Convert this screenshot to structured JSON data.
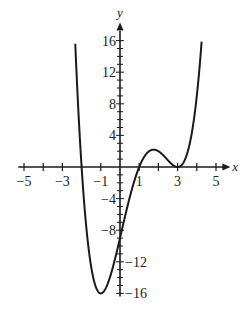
{
  "chart_data": {
    "type": "line",
    "title": "",
    "xlabel": "x",
    "ylabel": "y",
    "xlim": [
      -5.3,
      5.6
    ],
    "ylim": [
      -16.5,
      17.5
    ],
    "grid": false,
    "legend": null,
    "x_ticks_labeled": [
      -5,
      -3,
      -1,
      1,
      3,
      5
    ],
    "y_ticks_labeled": [
      16,
      12,
      8,
      4,
      -4,
      -8,
      -12,
      -16
    ],
    "x_tick_labels": [
      "−5",
      "−3",
      "−1",
      "1",
      "3",
      "5"
    ],
    "y_tick_labels": [
      "16",
      "12",
      "8",
      "4",
      "−4",
      "−8",
      "−12",
      "−16"
    ],
    "function": "y = 0.5(x+2)(x-1)(x-3)^2",
    "series": [
      {
        "name": "f(x)",
        "x": [
          -2.3,
          -2,
          -1.5,
          -1,
          -0.5,
          0,
          0.5,
          1,
          1.5,
          1.8,
          2,
          2.5,
          3,
          3.5,
          4,
          4.3
        ],
        "y": [
          15.6,
          0,
          -10.1,
          -16,
          -14.1,
          -9,
          -3.9,
          0,
          1.97,
          2.19,
          2.0,
          0.88,
          0,
          1.24,
          6,
          13.8
        ]
      }
    ],
    "key_points": {
      "zeros": [
        -2,
        1,
        3
      ],
      "y_intercept": -9,
      "local_min": [
        -1,
        -16
      ],
      "local_max": [
        1.8,
        2.2
      ],
      "double_root": 3
    }
  }
}
